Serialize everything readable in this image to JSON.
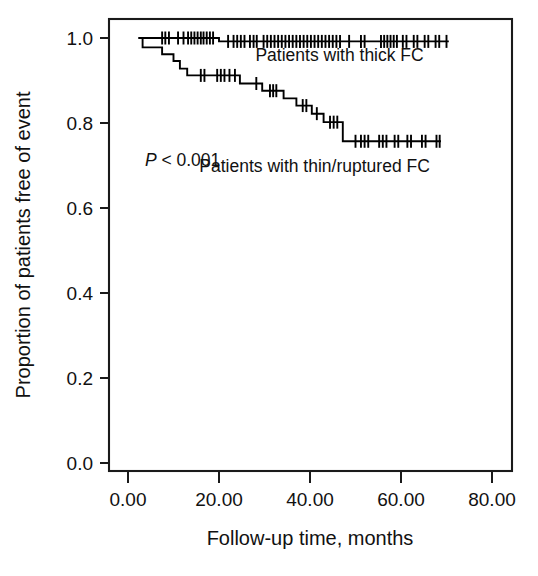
{
  "chart_data": {
    "type": "line",
    "subtype": "kaplan-meier-survival",
    "title": "",
    "xlabel": "Follow-up time, months",
    "ylabel": "Proportion of patients free of event",
    "xlim": [
      0,
      80
    ],
    "ylim": [
      0.0,
      1.0
    ],
    "xticks": [
      0,
      20,
      40,
      60,
      80
    ],
    "xticklabels": [
      "0.00",
      "20.00",
      "40.00",
      "60.00",
      "80.00"
    ],
    "yticks": [
      0.0,
      0.2,
      0.4,
      0.6,
      0.8,
      1.0
    ],
    "yticklabels": [
      "0.0",
      "0.2",
      "0.4",
      "0.6",
      "0.8",
      "1.0"
    ],
    "grid": false,
    "legend_position": "inline-annotations",
    "annotations": [
      {
        "name": "p-value",
        "text_italic": "P",
        "text": " < 0.001",
        "x": 12.0,
        "y": 0.7
      },
      {
        "name": "thick-fc-label",
        "text": "Patients with thick FC",
        "x": 46.5,
        "y": 0.945
      },
      {
        "name": "thin-fc-label",
        "text": "Patients with thin/ruptured FC",
        "x": 41.0,
        "y": 0.685
      }
    ],
    "series": [
      {
        "name": "Patients with thick FC",
        "label": "Patients with thick FC",
        "color": "#000000",
        "steps": [
          [
            2.3,
            1.0
          ],
          [
            20.0,
            1.0
          ],
          [
            20.0,
            0.992
          ],
          [
            70.5,
            0.992
          ]
        ],
        "censor_times": [
          7.5,
          8.2,
          9.0,
          11.0,
          12.2,
          13.2,
          13.9,
          14.6,
          15.3,
          16.0,
          16.6,
          17.3,
          18.0,
          18.7,
          22.0,
          23.2,
          24.0,
          24.8,
          25.6,
          26.8,
          27.6,
          28.3,
          29.8,
          30.6,
          31.4,
          32.2,
          33.0,
          33.8,
          34.6,
          35.4,
          36.2,
          37.0,
          37.8,
          38.6,
          39.4,
          40.2,
          41.0,
          41.8,
          42.6,
          43.4,
          44.2,
          45.0,
          45.8,
          46.6,
          48.6,
          51.2,
          52.0,
          55.6,
          56.3,
          57.0,
          57.7,
          58.4,
          59.1,
          60.4,
          61.2,
          62.8,
          63.6,
          65.2,
          66.0,
          67.6,
          68.4,
          70.0
        ]
      },
      {
        "name": "Patients with thin/ruptured FC",
        "label": "Patients with thin/ruptured FC",
        "color": "#000000",
        "steps": [
          [
            2.3,
            1.0
          ],
          [
            3.2,
            1.0
          ],
          [
            3.2,
            0.978
          ],
          [
            7.5,
            0.978
          ],
          [
            7.5,
            0.962
          ],
          [
            10.0,
            0.962
          ],
          [
            10.0,
            0.946
          ],
          [
            11.4,
            0.946
          ],
          [
            11.4,
            0.928
          ],
          [
            13.0,
            0.928
          ],
          [
            13.0,
            0.912
          ],
          [
            24.6,
            0.912
          ],
          [
            24.6,
            0.893
          ],
          [
            29.5,
            0.893
          ],
          [
            29.5,
            0.876
          ],
          [
            34.2,
            0.876
          ],
          [
            34.2,
            0.858
          ],
          [
            37.0,
            0.858
          ],
          [
            37.0,
            0.841
          ],
          [
            40.4,
            0.841
          ],
          [
            40.4,
            0.822
          ],
          [
            43.0,
            0.822
          ],
          [
            43.0,
            0.802
          ],
          [
            47.2,
            0.802
          ],
          [
            47.2,
            0.757
          ],
          [
            68.8,
            0.757
          ]
        ],
        "censor_times": [
          16.0,
          16.8,
          19.6,
          20.4,
          21.2,
          22.3,
          23.5,
          28.2,
          31.2,
          31.9,
          32.6,
          38.4,
          39.2,
          41.5,
          44.4,
          45.2,
          46.0,
          50.0,
          51.2,
          52.0,
          52.8,
          55.2,
          56.0,
          56.8,
          58.6,
          59.4,
          61.4,
          62.2,
          64.6,
          65.4,
          67.8,
          68.5
        ],
        "censor_y_override": null
      }
    ]
  },
  "axes": {
    "x_title": "Follow-up time, months",
    "y_title": "Proportion of patients free of event"
  }
}
